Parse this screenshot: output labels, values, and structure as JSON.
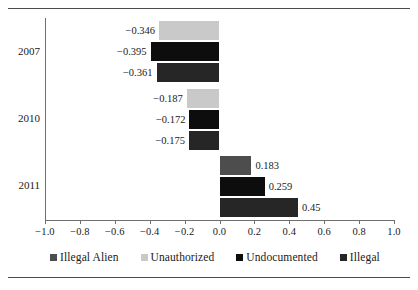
{
  "chart_data": {
    "type": "bar",
    "orientation": "horizontal",
    "title": "",
    "xlabel": "",
    "ylabel": "",
    "categories": [
      "2007",
      "2010",
      "2011"
    ],
    "xlim": [
      -1.0,
      1.0
    ],
    "xticks": [
      "−1.0",
      "−0.8",
      "−0.6",
      "−0.4",
      "−0.2",
      "0.0",
      "0.2",
      "0.4",
      "0.6",
      "0.8",
      "1.0"
    ],
    "xtick_values": [
      -1.0,
      -0.8,
      -0.6,
      -0.4,
      -0.2,
      0.0,
      0.2,
      0.4,
      0.6,
      0.8,
      1.0
    ],
    "grid": false,
    "legend_position": "bottom",
    "series": [
      {
        "name": "Illegal Alien",
        "color": "#4d4d4d",
        "values": [
          null,
          null,
          0.183
        ],
        "labels": [
          "",
          "",
          "0.183"
        ]
      },
      {
        "name": "Unauthorized",
        "color": "#c9c9c9",
        "values": [
          -0.346,
          -0.187,
          null
        ],
        "labels": [
          "−0.346",
          "−0.187",
          ""
        ]
      },
      {
        "name": "Undocumented",
        "color": "#0d0d0d",
        "values": [
          -0.395,
          -0.172,
          0.259
        ],
        "labels": [
          "−0.395",
          "−0.172",
          "0.259"
        ]
      },
      {
        "name": "Illegal",
        "color": "#262626",
        "values": [
          -0.361,
          -0.175,
          0.45
        ],
        "labels": [
          "−0.361",
          "−0.175",
          "0.45"
        ]
      }
    ],
    "bars": [
      {
        "group": "2007",
        "series": "Unauthorized",
        "value": -0.346,
        "label": "−0.346",
        "color": "#c9c9c9"
      },
      {
        "group": "2007",
        "series": "Undocumented",
        "value": -0.395,
        "label": "−0.395",
        "color": "#0d0d0d"
      },
      {
        "group": "2007",
        "series": "Illegal",
        "value": -0.361,
        "label": "−0.361",
        "color": "#262626"
      },
      {
        "group": "2010",
        "series": "Unauthorized",
        "value": -0.187,
        "label": "−0.187",
        "color": "#c9c9c9"
      },
      {
        "group": "2010",
        "series": "Undocumented",
        "value": -0.172,
        "label": "−0.172",
        "color": "#0d0d0d"
      },
      {
        "group": "2010",
        "series": "Illegal",
        "value": -0.175,
        "label": "−0.175",
        "color": "#262626"
      },
      {
        "group": "2011",
        "series": "Illegal Alien",
        "value": 0.183,
        "label": "0.183",
        "color": "#4d4d4d"
      },
      {
        "group": "2011",
        "series": "Undocumented",
        "value": 0.259,
        "label": "0.259",
        "color": "#0d0d0d"
      },
      {
        "group": "2011",
        "series": "Illegal",
        "value": 0.45,
        "label": "0.45",
        "color": "#262626"
      }
    ]
  },
  "axis": {
    "year_2007": "2007",
    "year_2010": "2010",
    "year_2011": "2011",
    "t0": "−1.0",
    "t1": "−0.8",
    "t2": "−0.6",
    "t3": "−0.4",
    "t4": "−0.2",
    "t5": "0.0",
    "t6": "0.2",
    "t7": "0.4",
    "t8": "0.6",
    "t9": "0.8",
    "t10": "1.0"
  },
  "legend": {
    "items": [
      {
        "label": "Illegal Alien",
        "color": "#4d4d4d"
      },
      {
        "label": "Unauthorized",
        "color": "#c9c9c9"
      },
      {
        "label": "Undocumented",
        "color": "#0d0d0d"
      },
      {
        "label": "Illegal",
        "color": "#262626"
      }
    ]
  },
  "values": {
    "v2007_unauthorized": "−0.346",
    "v2007_undocumented": "−0.395",
    "v2007_illegal": "−0.361",
    "v2010_unauthorized": "−0.187",
    "v2010_undocumented": "−0.172",
    "v2010_illegal": "−0.175",
    "v2011_illegalalien": "0.183",
    "v2011_undocumented": "0.259",
    "v2011_illegal": "0.45"
  }
}
